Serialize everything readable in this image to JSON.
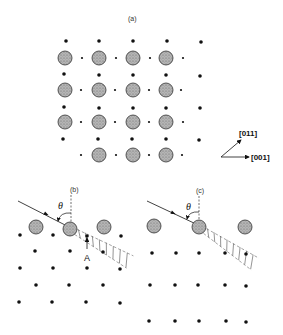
{
  "colors": {
    "background": "#ffffff",
    "ink": "#111111",
    "atom_fill": "#a8a8a8",
    "atom_stroke": "#333333",
    "hatch": "#666666"
  },
  "panel_a": {
    "label": "(a)",
    "label_pos": [
      128,
      21
    ],
    "large_atoms": {
      "radius": 7,
      "points": [
        [
          65,
          58
        ],
        [
          99,
          58
        ],
        [
          133,
          58
        ],
        [
          166,
          58
        ],
        [
          65,
          90
        ],
        [
          99,
          90
        ],
        [
          133,
          90
        ],
        [
          166,
          90
        ],
        [
          65,
          122
        ],
        [
          99,
          122
        ],
        [
          133,
          122
        ],
        [
          166,
          122
        ],
        [
          99,
          155
        ],
        [
          133,
          155
        ],
        [
          166,
          155
        ]
      ]
    },
    "small_dots_mid": {
      "radius": 1.1,
      "points": [
        [
          82,
          58
        ],
        [
          116,
          58
        ],
        [
          150,
          58
        ],
        [
          183,
          58
        ],
        [
          81,
          90
        ],
        [
          115,
          90
        ],
        [
          149,
          90
        ],
        [
          181,
          90
        ],
        [
          81,
          122
        ],
        [
          115,
          122
        ],
        [
          149,
          122
        ],
        [
          183,
          122
        ],
        [
          81,
          155
        ],
        [
          116,
          155
        ],
        [
          149,
          155
        ],
        [
          182,
          155
        ]
      ]
    },
    "dots": {
      "radius": 1.8,
      "points": [
        [
          66,
          41
        ],
        [
          99,
          41
        ],
        [
          133,
          41
        ],
        [
          167,
          41
        ],
        [
          201,
          42
        ],
        [
          64,
          74
        ],
        [
          99,
          75
        ],
        [
          133,
          75
        ],
        [
          166,
          75
        ],
        [
          200,
          76
        ],
        [
          64,
          107
        ],
        [
          99,
          108
        ],
        [
          133,
          108
        ],
        [
          166,
          108
        ],
        [
          200,
          108
        ],
        [
          63,
          139
        ],
        [
          98,
          139
        ],
        [
          132,
          139
        ],
        [
          166,
          139
        ],
        [
          199,
          140
        ]
      ]
    },
    "axes": {
      "origin": [
        221,
        157
      ],
      "arrow_011": {
        "tip": [
          241,
          140
        ],
        "label": "[011]",
        "label_pos": [
          239,
          136
        ]
      },
      "arrow_001": {
        "tip": [
          249,
          157
        ],
        "label": "[001]",
        "label_pos": [
          251,
          160
        ]
      }
    }
  },
  "panel_b": {
    "label": "(b)",
    "label_pos": [
      70,
      192
    ],
    "normal_line": {
      "x": 71,
      "y1": 195,
      "y2": 230
    },
    "incident": {
      "from": [
        18,
        201
      ],
      "to": [
        69,
        227
      ],
      "arrow_at": [
        46,
        214
      ]
    },
    "theta": {
      "text": "θ",
      "pos": [
        58,
        209
      ]
    },
    "angle_arc": {
      "from": [
        58,
        221
      ],
      "to": [
        71,
        213
      ]
    },
    "large_atoms": {
      "radius": 7,
      "points": [
        [
          36,
          227
        ],
        [
          70,
          229
        ],
        [
          104,
          227
        ]
      ]
    },
    "dots": {
      "radius": 1.8,
      "points": [
        [
          20,
          235
        ],
        [
          53,
          235
        ],
        [
          87,
          236
        ],
        [
          121,
          236
        ],
        [
          35,
          251
        ],
        [
          70,
          251
        ],
        [
          103,
          252
        ],
        [
          20,
          268
        ],
        [
          53,
          268
        ],
        [
          87,
          268
        ],
        [
          120,
          269
        ],
        [
          36,
          285
        ],
        [
          69,
          285
        ],
        [
          103,
          285
        ],
        [
          19,
          302
        ],
        [
          52,
          302
        ],
        [
          86,
          302
        ],
        [
          120,
          303
        ]
      ]
    },
    "shadow_cone": {
      "start": [
        76,
        232
      ],
      "end": [
        130,
        262
      ],
      "width": 14,
      "hatch_count": 8
    },
    "marker": {
      "label": "A",
      "label_pos": [
        84,
        261
      ],
      "arrow_from": [
        87,
        249
      ],
      "arrow_to": [
        87,
        238
      ]
    }
  },
  "panel_c": {
    "label": "(c)",
    "label_pos": [
      196,
      193
    ],
    "normal_line": {
      "x": 199,
      "y1": 196,
      "y2": 226
    },
    "incident": {
      "from": [
        147,
        201
      ],
      "to": [
        196,
        224
      ],
      "arrow_at": [
        173,
        213
      ]
    },
    "theta": {
      "text": "θ",
      "pos": [
        186,
        210
      ]
    },
    "angle_arc": {
      "from": [
        187,
        219
      ],
      "to": [
        199,
        212
      ]
    },
    "large_atoms": {
      "radius": 7,
      "points": [
        [
          154,
          226
        ],
        [
          199,
          227
        ],
        [
          245,
          227
        ]
      ]
    },
    "dots": {
      "radius": 1.8,
      "points": [
        [
          152,
          253
        ],
        [
          176,
          253
        ],
        [
          199,
          253
        ],
        [
          225,
          253
        ],
        [
          246,
          254
        ],
        [
          150,
          285
        ],
        [
          175,
          285
        ],
        [
          198,
          285
        ],
        [
          225,
          285
        ],
        [
          246,
          286
        ],
        [
          149,
          321
        ],
        [
          175,
          321
        ],
        [
          199,
          321
        ],
        [
          226,
          321
        ],
        [
          246,
          322
        ]
      ]
    },
    "shadow_cone": {
      "start": [
        205,
        231
      ],
      "end": [
        255,
        264
      ],
      "width": 14,
      "hatch_count": 8
    }
  }
}
